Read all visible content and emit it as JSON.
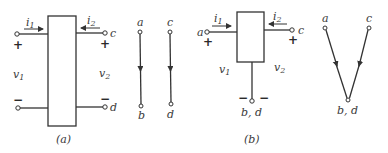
{
  "figure": {
    "a": {
      "caption": "(a)",
      "current_left": "i1",
      "current_left_sub": "1",
      "current_right": "i2",
      "current_right_sub": "2",
      "voltage_left": "v1",
      "voltage_right": "v2",
      "plus": "+",
      "minus": "−",
      "terminal_c": "c",
      "terminal_d": "d",
      "graph": {
        "edge1": {
          "from": "a",
          "to": "b"
        },
        "edge2": {
          "from": "c",
          "to": "d"
        }
      }
    },
    "b": {
      "caption": "(b)",
      "terminal_a": "a",
      "terminal_c": "c",
      "common_terminal": "b, d",
      "plus": "+",
      "minus": "−",
      "voltage_left": "v1",
      "voltage_right": "v2",
      "graph": {
        "node_a": "a",
        "node_c": "c",
        "node_bottom": "b, d"
      }
    }
  }
}
